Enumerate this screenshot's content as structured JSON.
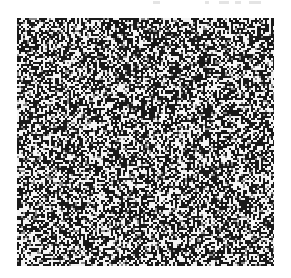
{
  "canvas": {
    "width": 291,
    "height": 278,
    "background": "#ffffff"
  },
  "noise_field": {
    "x": 17,
    "y": 18,
    "width": 257,
    "height": 248,
    "cell_size": 2,
    "dark_color": "#1a1a1a",
    "light_color": "#f4f4f4",
    "mid_color": "#8a8a8a",
    "dark_ratio": 0.5,
    "seed": 1337
  },
  "top_marks": [
    {
      "x": 0,
      "width": 7
    },
    {
      "x": 52,
      "width": 4
    },
    {
      "x": 66,
      "width": 10
    },
    {
      "x": 82,
      "width": 6
    },
    {
      "x": 96,
      "width": 12
    }
  ]
}
